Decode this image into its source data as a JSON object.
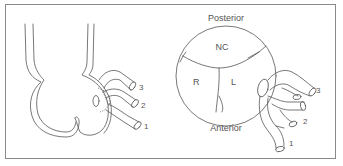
{
  "figure": {
    "left_panel": {
      "description": "Lateral view of aortic root with coronary artery origins",
      "vessel_labels": [
        "1",
        "2",
        "3"
      ]
    },
    "right_panel": {
      "top_label": "Posterior",
      "bottom_label": "Anterior",
      "cusp_labels": {
        "noncoronary": "NC",
        "right": "R",
        "left": "L"
      },
      "vessel_labels": [
        "1",
        "2",
        "3"
      ]
    },
    "colors": {
      "stroke": "#555555",
      "border": "#8a8a8a",
      "background": "#ffffff"
    }
  }
}
